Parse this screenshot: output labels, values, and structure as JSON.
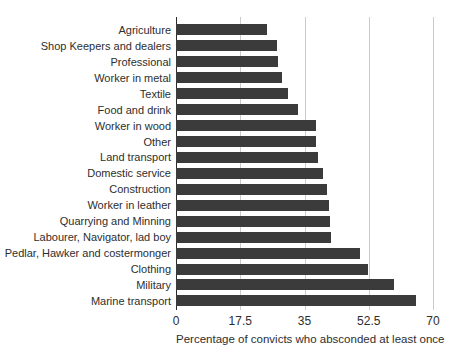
{
  "chart_data": {
    "type": "bar",
    "orientation": "horizontal",
    "title": "",
    "xlabel": "Percentage of convicts who absconded at least once",
    "ylabel": "",
    "xlim": [
      0,
      70
    ],
    "xticks": [
      0,
      17.5,
      35,
      52.5,
      70
    ],
    "xtick_labels": [
      "0",
      "17.5",
      "35",
      "52.5",
      "70"
    ],
    "grid": "vertical-gridlines-on",
    "legend": "none",
    "categories": [
      "Agriculture",
      "Shop Keepers and dealers",
      "Professional",
      "Worker in metal",
      "Textile",
      "Food and drink",
      "Worker in wood",
      "Other",
      "Land transport",
      "Domestic service",
      "Construction",
      "Worker in leather",
      "Quarrying and Minning",
      "Labourer, Navigator, lad boy",
      "Pedlar, Hawker and costermonger",
      "Clothing",
      "Military",
      "Marine transport"
    ],
    "values": [
      24.7,
      27.4,
      27.9,
      28.8,
      30.6,
      33.3,
      38.1,
      38.1,
      38.6,
      40.1,
      41.2,
      41.7,
      41.9,
      42.2,
      50.1,
      52.2,
      59.3,
      65.5
    ],
    "colors": {
      "bar": "#3b3b3b",
      "gridline": "#cccccc",
      "zero_axis_line": "#2b2b2b",
      "text": "#2e2e2e",
      "background": "#ffffff"
    }
  }
}
